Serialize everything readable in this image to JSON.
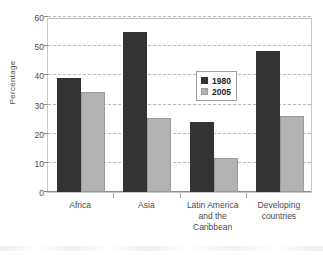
{
  "chart_data": {
    "type": "bar",
    "title": "",
    "subtitle": "",
    "xlabel": "",
    "ylabel": "Percentage",
    "ylim": [
      0,
      60
    ],
    "yticks": [
      0,
      10,
      20,
      30,
      40,
      50,
      60
    ],
    "ytick_labels": [
      "0",
      "10",
      "20",
      "30",
      "40",
      "50",
      "60"
    ],
    "grid": "horizontal-dashed",
    "legend_position": "center-right-inside",
    "categories": [
      "Africa",
      "Asia",
      "Latin America and the Caribbean",
      "Developing countries"
    ],
    "category_lines": [
      [
        "Africa"
      ],
      [
        "Asia"
      ],
      [
        "Latin America",
        "and the",
        "Caribbean"
      ],
      [
        "Developing",
        "countries"
      ]
    ],
    "series": [
      {
        "name": "1980",
        "color": "#333333",
        "values": [
          39.0,
          55.0,
          24.0,
          48.3
        ]
      },
      {
        "name": "2005",
        "color": "#b2b2b2",
        "values": [
          34.4,
          25.5,
          11.5,
          26.1
        ]
      }
    ]
  },
  "legend": {
    "items": [
      {
        "label": "1980",
        "swatch": "series-1980-swatch"
      },
      {
        "label": "2005",
        "swatch": "series-2005-swatch"
      }
    ]
  },
  "colors": {
    "series_1980": "#333333",
    "series_2005": "#b2b2b2",
    "gridline": "#b9b9b9",
    "axis": "#8c8c8c",
    "frame": "#c9c9c9",
    "text": "#4a4a4a",
    "background": "#ffffff"
  }
}
